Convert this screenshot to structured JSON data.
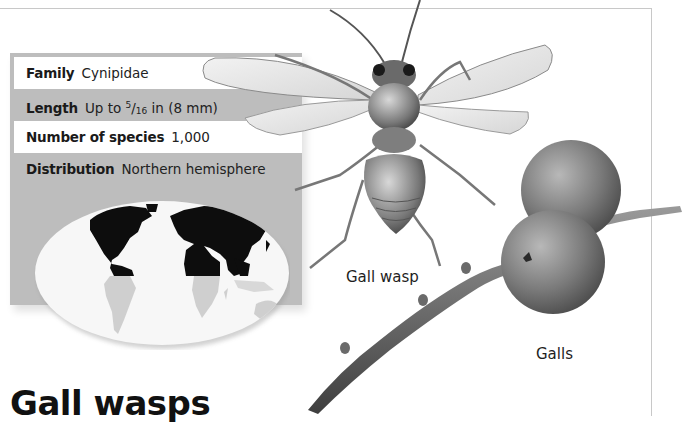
{
  "page": {
    "title": "Gall wasps"
  },
  "factbox": {
    "rows": [
      {
        "label": "Family",
        "value": "Cynipidae",
        "style": "white"
      },
      {
        "label": "Length",
        "value_prefix": "Up to ",
        "fraction_numerator": "5",
        "fraction_denominator": "16",
        "value_suffix": " in (8 mm)",
        "style": "gray"
      },
      {
        "label": "Number of species",
        "value": "1,000",
        "style": "white"
      },
      {
        "label": "Distribution",
        "value": "Northern hemisphere",
        "style": "gray"
      }
    ]
  },
  "map": {
    "description": "World map with northern hemisphere highlighted",
    "highlighted_region": "Northern hemisphere",
    "colors": {
      "highlight": "#0d0d0d",
      "land_other": "#cfcfcf",
      "ocean": "#f7f7f7"
    }
  },
  "illustrations": {
    "wasp": {
      "caption": "Gall wasp"
    },
    "galls": {
      "caption": "Galls"
    }
  },
  "colors": {
    "factbox_gray": "#bdbdbd",
    "frame_line": "#c8c8c8"
  }
}
